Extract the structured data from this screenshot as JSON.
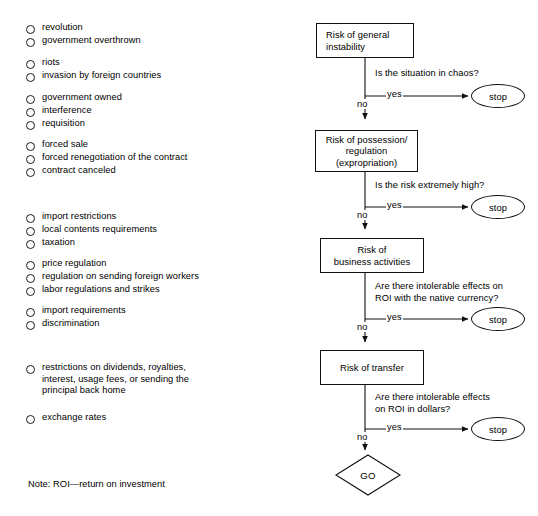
{
  "risk_list": {
    "groups": [
      {
        "top": 22,
        "items": [
          "revolution",
          "government overthrown"
        ]
      },
      {
        "top": 57,
        "items": [
          "riots",
          "invasion by foreign countries"
        ]
      },
      {
        "top": 92,
        "items": [
          "government owned",
          "interference",
          "requisition"
        ]
      },
      {
        "top": 139,
        "items": [
          "forced sale",
          "forced renegotiation of the contract",
          "contract canceled"
        ]
      },
      {
        "top": 211,
        "items": [
          "import restrictions",
          "local contents requirements",
          "taxation"
        ]
      },
      {
        "top": 258,
        "items": [
          "price regulation",
          "regulation on sending foreign workers",
          "labor regulations and strikes"
        ]
      },
      {
        "top": 305,
        "items": [
          "import requirements",
          "discrimination"
        ]
      },
      {
        "top": 362,
        "items": [
          "restrictions on dividends, royalties,\ninterest, usage fees, or sending the\nprincipal back home"
        ]
      },
      {
        "top": 412,
        "items": [
          "exchange rates"
        ]
      }
    ]
  },
  "note": "Note:  ROI—return on investment",
  "flowchart": {
    "nodes": [
      {
        "id": "risk-general-instability",
        "label": "Risk of general\ninstability",
        "shape": "box",
        "align": "left"
      },
      {
        "id": "risk-possession-regulation",
        "label": "Risk of possession/\nregulation\n(expropriation)",
        "shape": "box",
        "align": "center"
      },
      {
        "id": "risk-business-activities",
        "label": "Risk of\nbusiness activities",
        "shape": "box",
        "align": "center"
      },
      {
        "id": "risk-transfer",
        "label": "Risk of transfer",
        "shape": "box",
        "align": "center"
      }
    ],
    "decisions": [
      {
        "question": "Is the situation in chaos?",
        "yes_label": "yes",
        "no_label": "no",
        "stop_label": "stop"
      },
      {
        "question": "Is the risk extremely high?",
        "yes_label": "yes",
        "no_label": "no",
        "stop_label": "stop"
      },
      {
        "question": "Are there intolerable effects on\nROI with the native currency?",
        "yes_label": "yes",
        "no_label": "no",
        "stop_label": "stop"
      },
      {
        "question": "Are there intolerable effects\non ROI in dollars?",
        "yes_label": "yes",
        "no_label": "no",
        "stop_label": "stop"
      }
    ],
    "terminal": {
      "id": "go-node",
      "label": "GO",
      "shape": "diamond"
    }
  },
  "colors": {
    "stroke": "#111111",
    "text": "#000000",
    "background": "#ffffff"
  }
}
